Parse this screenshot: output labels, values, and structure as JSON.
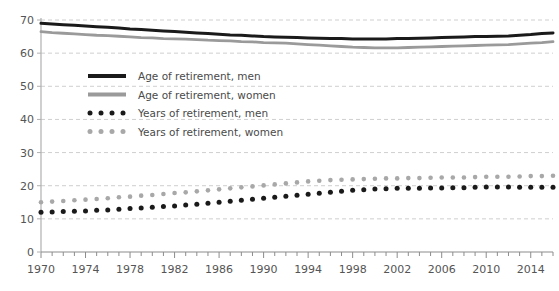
{
  "chart_data": {
    "type": "line",
    "title": "",
    "xlabel": "",
    "ylabel": "",
    "xlim": [
      1970,
      2016
    ],
    "ylim": [
      0,
      70
    ],
    "ytick_step": 10,
    "yticks": [
      0,
      10,
      20,
      30,
      40,
      50,
      60,
      70
    ],
    "xticks_labeled": [
      1970,
      1974,
      1978,
      1982,
      1986,
      1990,
      1994,
      1998,
      2002,
      2006,
      2010,
      2014
    ],
    "xtick_minor_step": 1,
    "grid": "horizontal-dashed",
    "legend_position": "upper-left-inside",
    "x": [
      1970,
      1971,
      1972,
      1973,
      1974,
      1975,
      1976,
      1977,
      1978,
      1979,
      1980,
      1981,
      1982,
      1983,
      1984,
      1985,
      1986,
      1987,
      1988,
      1989,
      1990,
      1991,
      1992,
      1993,
      1994,
      1995,
      1996,
      1997,
      1998,
      1999,
      2000,
      2001,
      2002,
      2003,
      2004,
      2005,
      2006,
      2007,
      2008,
      2009,
      2010,
      2011,
      2012,
      2013,
      2014,
      2015,
      2016
    ],
    "series": [
      {
        "name": "Age of retirement, men",
        "style": "solid",
        "color": "#1a1a1a",
        "values": [
          69.0,
          68.8,
          68.6,
          68.4,
          68.2,
          68.0,
          67.8,
          67.6,
          67.3,
          67.1,
          66.9,
          66.7,
          66.5,
          66.3,
          66.1,
          65.9,
          65.7,
          65.5,
          65.4,
          65.2,
          65.0,
          64.9,
          64.8,
          64.7,
          64.6,
          64.5,
          64.4,
          64.4,
          64.3,
          64.3,
          64.3,
          64.3,
          64.4,
          64.4,
          64.5,
          64.6,
          64.7,
          64.8,
          64.9,
          65.0,
          65.0,
          65.1,
          65.2,
          65.4,
          65.6,
          65.9,
          66.1
        ]
      },
      {
        "name": "Age of retirement, women",
        "style": "solid",
        "color": "#9a9a9a",
        "values": [
          66.5,
          66.2,
          66.0,
          65.8,
          65.6,
          65.4,
          65.3,
          65.1,
          64.9,
          64.7,
          64.6,
          64.4,
          64.3,
          64.2,
          64.1,
          63.9,
          63.8,
          63.7,
          63.5,
          63.4,
          63.2,
          63.1,
          63.0,
          62.8,
          62.6,
          62.4,
          62.2,
          62.0,
          61.8,
          61.7,
          61.6,
          61.6,
          61.6,
          61.7,
          61.8,
          61.9,
          62.0,
          62.1,
          62.2,
          62.3,
          62.4,
          62.5,
          62.6,
          62.8,
          63.0,
          63.2,
          63.5
        ]
      },
      {
        "name": "Years of retirement, men",
        "style": "dotted",
        "color": "#1a1a1a",
        "values": [
          12.0,
          12.1,
          12.2,
          12.3,
          12.4,
          12.6,
          12.7,
          12.9,
          13.1,
          13.3,
          13.5,
          13.7,
          13.9,
          14.2,
          14.4,
          14.7,
          15.0,
          15.3,
          15.6,
          15.9,
          16.2,
          16.5,
          16.8,
          17.1,
          17.4,
          17.7,
          18.0,
          18.3,
          18.6,
          18.8,
          19.0,
          19.1,
          19.2,
          19.2,
          19.2,
          19.3,
          19.3,
          19.4,
          19.4,
          19.5,
          19.6,
          19.6,
          19.6,
          19.5,
          19.5,
          19.5,
          19.5
        ]
      },
      {
        "name": "Years of retirement, women",
        "style": "dotted",
        "color": "#a8a8a8",
        "values": [
          15.0,
          15.2,
          15.4,
          15.6,
          15.8,
          16.0,
          16.2,
          16.5,
          16.7,
          17.0,
          17.2,
          17.5,
          17.8,
          18.0,
          18.3,
          18.6,
          18.9,
          19.2,
          19.5,
          19.8,
          20.1,
          20.4,
          20.7,
          21.0,
          21.3,
          21.5,
          21.7,
          21.8,
          21.9,
          22.0,
          22.1,
          22.2,
          22.2,
          22.3,
          22.3,
          22.4,
          22.5,
          22.5,
          22.5,
          22.6,
          22.7,
          22.7,
          22.7,
          22.8,
          22.9,
          22.9,
          23.0
        ]
      }
    ]
  },
  "legend": {
    "items": [
      {
        "label": "Age of retirement, men",
        "swatch": "solid-black"
      },
      {
        "label": "Age of retirement, women",
        "swatch": "solid-grey"
      },
      {
        "label": "Years of retirement, men",
        "swatch": "dotted-black"
      },
      {
        "label": "Years of retirement, women",
        "swatch": "dotted-grey"
      }
    ]
  },
  "colors": {
    "men_solid": "#1a1a1a",
    "women_solid": "#9a9a9a",
    "men_dotted": "#1a1a1a",
    "women_dotted": "#a8a8a8",
    "grid": "#cfcfcf",
    "axis": "#b0b0b0",
    "text": "#555555",
    "background": "#ffffff"
  }
}
